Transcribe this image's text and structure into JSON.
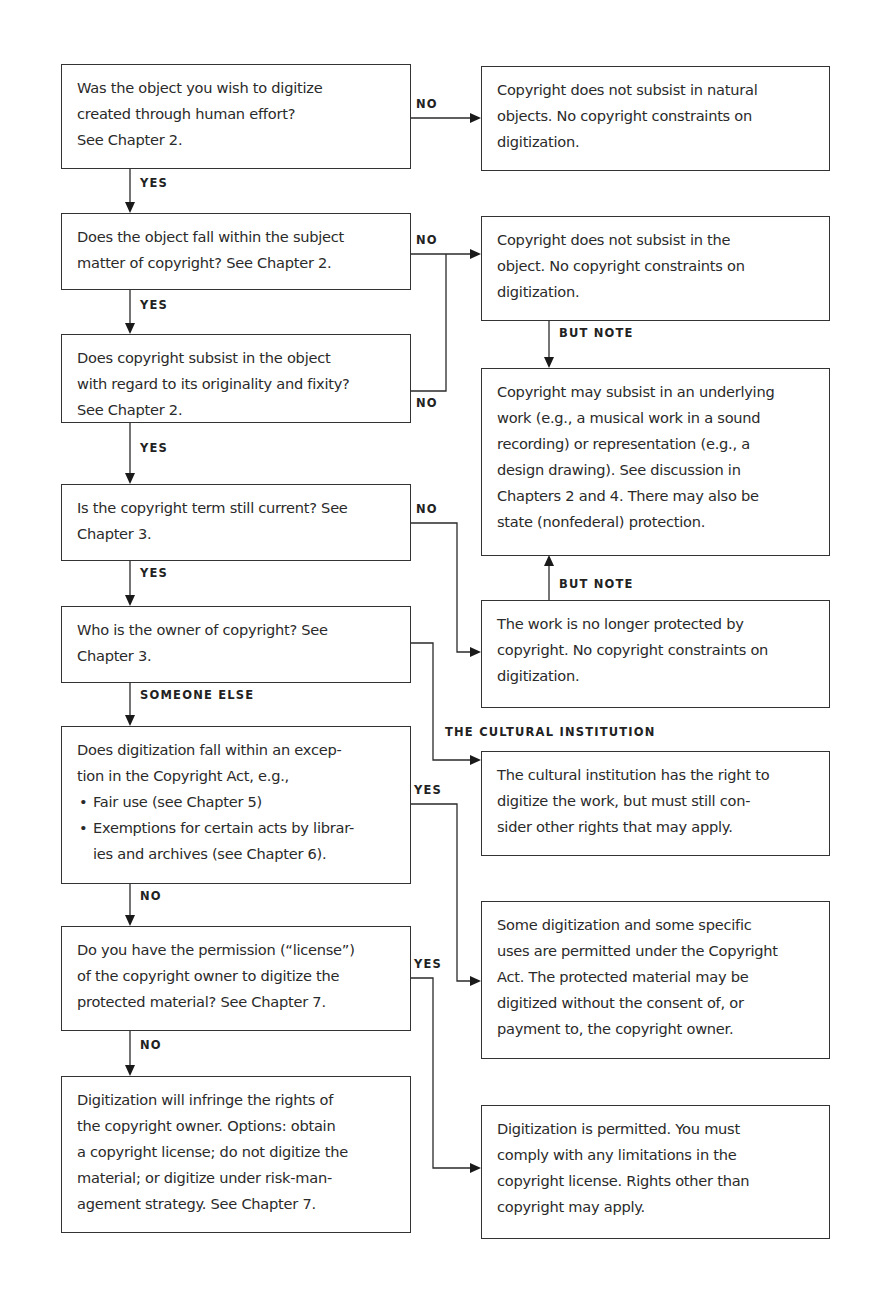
{
  "flowchart": {
    "questions": [
      {
        "id": "q1",
        "lines": [
          "Was the object you wish to digitize",
          "created through human effort?",
          "See Chapter 2."
        ]
      },
      {
        "id": "q2",
        "lines": [
          "Does the object fall within the subject",
          "matter of copyright? See Chapter 2."
        ]
      },
      {
        "id": "q3",
        "lines": [
          "Does copyright subsist in the object",
          "with regard to its originality and fixity?",
          "See Chapter 2."
        ]
      },
      {
        "id": "q4",
        "lines": [
          "Is the copyright term still current? See",
          "Chapter 3."
        ]
      },
      {
        "id": "q5",
        "lines": [
          "Who is the owner of copyright? See",
          "Chapter 3."
        ]
      },
      {
        "id": "q6",
        "lines": [
          "Does digitization fall within an excep-",
          "tion in the Copyright Act, e.g.,"
        ],
        "bullets": [
          [
            "Fair use (see Chapter 5)"
          ],
          [
            "Exemptions for certain acts by librar-",
            "ies and archives (see Chapter 6)."
          ]
        ]
      },
      {
        "id": "q7",
        "lines": [
          "Do you have the permission (“license”)",
          "of the copyright owner to digitize the",
          "protected material? See Chapter 7."
        ]
      },
      {
        "id": "q8",
        "lines": [
          "Digitization will infringe the rights of",
          "the copyright owner. Options: obtain",
          "a copyright license; do not digitize the",
          "material; or digitize under risk-man-",
          "agement strategy. See Chapter 7."
        ]
      }
    ],
    "outcomes": [
      {
        "id": "r1",
        "lines": [
          "Copyright does not subsist in natural",
          "objects. No copyright constraints on",
          "digitization."
        ]
      },
      {
        "id": "r2",
        "lines": [
          "Copyright does not subsist in the",
          "object. No copyright constraints on",
          "digitization."
        ]
      },
      {
        "id": "r3",
        "lines": [
          "Copyright may subsist in an underlying",
          "work (e.g., a musical work in a sound",
          "recording) or representation (e.g., a",
          "design drawing). See discussion in",
          "Chapters 2 and 4. There may also be",
          "state (nonfederal) protection."
        ]
      },
      {
        "id": "r4",
        "lines": [
          "The work is no longer protected by",
          "copyright. No copyright constraints on",
          "digitization."
        ]
      },
      {
        "id": "r5",
        "lines": [
          "The cultural institution has the right to",
          "digitize the work, but must still con-",
          "sider other rights that may apply."
        ]
      },
      {
        "id": "r6",
        "lines": [
          "Some digitization and some specific",
          "uses are permitted under the Copyright",
          "Act. The protected material may be",
          "digitized without the consent of, or",
          "payment to, the copyright owner."
        ]
      },
      {
        "id": "r7",
        "lines": [
          "Digitization is permitted. You must",
          "comply with any limitations in the",
          "copyright license. Rights other than",
          "copyright may apply."
        ]
      }
    ],
    "edge_labels": {
      "q1_no": "NO",
      "q1_yes": "YES",
      "q2_no": "NO",
      "q2_yes": "YES",
      "q3_no": "NO",
      "q3_yes": "YES",
      "q4_no": "NO",
      "q4_yes": "YES",
      "q5_someone_else": "SOMEONE ELSE",
      "q5_institution": "THE CULTURAL INSTITUTION",
      "q6_yes": "YES",
      "q6_no": "NO",
      "q7_yes": "YES",
      "q7_no": "NO",
      "r2_but_note": "BUT NOTE",
      "r4_but_note": "BUT NOTE"
    }
  }
}
